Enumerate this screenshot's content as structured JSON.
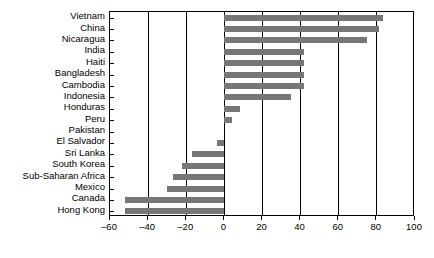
{
  "chart_data": {
    "type": "bar",
    "orientation": "horizontal",
    "title": "",
    "xlabel": "",
    "ylabel": "",
    "xlim": [
      -60,
      100
    ],
    "xticks": [
      -60,
      -40,
      -20,
      0,
      20,
      40,
      60,
      80,
      100
    ],
    "xtick_labels": [
      "–60",
      "–40",
      "–20",
      "0",
      "20",
      "40",
      "60",
      "80",
      "100"
    ],
    "grid": true,
    "legend": false,
    "bar_color": "#767676",
    "frame_color": "#000000",
    "categories": [
      "Vietnam",
      "China",
      "Nicaragua",
      "India",
      "Haiti",
      "Bangladesh",
      "Cambodia",
      "Indonesia",
      "Honduras",
      "Peru",
      "Pakistan",
      "El Salvador",
      "Sri Lanka",
      "South Korea",
      "Sub-Saharan Africa",
      "Mexico",
      "Canada",
      "Hong Kong"
    ],
    "values": [
      83,
      81,
      75,
      42,
      42,
      42,
      42,
      35,
      8,
      4,
      0,
      -4,
      -17,
      -22,
      -27,
      -30,
      -52,
      -52
    ]
  }
}
